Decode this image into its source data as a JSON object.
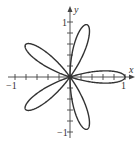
{
  "figure": {
    "type": "polar-rose",
    "equation": "r = cos(5θ)",
    "petals": 5,
    "petal_angles_deg": [
      0,
      72,
      144,
      216,
      288
    ],
    "axes": {
      "x_label": "x",
      "y_label": "y",
      "x_min_label": "−1",
      "x_max_label": "1",
      "y_min_label": "−1",
      "y_max_label": "1",
      "xlim": [
        -1,
        1
      ],
      "ylim": [
        -1,
        1
      ],
      "tick_step": 0.2
    },
    "colors": {
      "curve": "#333333",
      "axes": "#444444",
      "background": "#ffffff"
    }
  }
}
